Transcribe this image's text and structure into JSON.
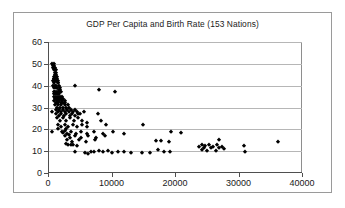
{
  "chart_data": {
    "type": "scatter",
    "title": "GDP Per Capita and Birth Rate (153 Nations)",
    "xlabel": "",
    "ylabel": "",
    "xlim": [
      0,
      40000
    ],
    "ylim": [
      0,
      60
    ],
    "xticks": [
      0,
      10000,
      20000,
      30000,
      40000
    ],
    "yticks": [
      0,
      10,
      20,
      30,
      40,
      50,
      60
    ],
    "xtick_labels": [
      "0",
      "10000",
      "20000",
      "30000",
      "40000"
    ],
    "ytick_labels": [
      "0",
      "10",
      "20",
      "30",
      "40",
      "50",
      "60"
    ],
    "grid": "horizontal",
    "legend": "none",
    "marker": "diamond",
    "marker_color": "#000000",
    "n_points": 153,
    "series": [
      {
        "name": "Nations",
        "points": [
          [
            700,
            50
          ],
          [
            760,
            49
          ],
          [
            820,
            48
          ],
          [
            900,
            50
          ],
          [
            950,
            47
          ],
          [
            1000,
            49
          ],
          [
            1050,
            46
          ],
          [
            1100,
            48
          ],
          [
            1150,
            45
          ],
          [
            1200,
            47
          ],
          [
            900,
            44
          ],
          [
            1000,
            43
          ],
          [
            1100,
            44
          ],
          [
            1250,
            46
          ],
          [
            1300,
            45
          ],
          [
            800,
            42
          ],
          [
            880,
            43
          ],
          [
            960,
            41
          ],
          [
            1050,
            42
          ],
          [
            1150,
            43
          ],
          [
            1250,
            42
          ],
          [
            1350,
            44
          ],
          [
            1400,
            43
          ],
          [
            1500,
            42
          ],
          [
            1550,
            41
          ],
          [
            850,
            40
          ],
          [
            950,
            39
          ],
          [
            1100,
            40
          ],
          [
            1200,
            39
          ],
          [
            1320,
            40
          ],
          [
            1450,
            39
          ],
          [
            1600,
            41
          ],
          [
            1700,
            40
          ],
          [
            1750,
            38
          ],
          [
            1850,
            39
          ],
          [
            900,
            37
          ],
          [
            1000,
            36
          ],
          [
            1150,
            37
          ],
          [
            1300,
            36
          ],
          [
            1400,
            37
          ],
          [
            1550,
            36
          ],
          [
            1700,
            37
          ],
          [
            1800,
            36
          ],
          [
            1950,
            38
          ],
          [
            2050,
            37
          ],
          [
            950,
            35
          ],
          [
            1100,
            34
          ],
          [
            1250,
            35
          ],
          [
            1400,
            34
          ],
          [
            1550,
            35
          ],
          [
            1700,
            34
          ],
          [
            1850,
            35
          ],
          [
            2000,
            34
          ],
          [
            2150,
            35
          ],
          [
            2300,
            34
          ],
          [
            1000,
            33
          ],
          [
            1200,
            32
          ],
          [
            1400,
            33
          ],
          [
            1600,
            32
          ],
          [
            1800,
            33
          ],
          [
            2000,
            32
          ],
          [
            2200,
            33
          ],
          [
            2400,
            32
          ],
          [
            2600,
            33
          ],
          [
            2750,
            32
          ],
          [
            1100,
            31
          ],
          [
            1350,
            30
          ],
          [
            1600,
            31
          ],
          [
            1850,
            30
          ],
          [
            2100,
            31
          ],
          [
            2350,
            30
          ],
          [
            2600,
            31
          ],
          [
            2850,
            30
          ],
          [
            3100,
            31
          ],
          [
            3300,
            30
          ],
          [
            600,
            28
          ],
          [
            1200,
            29
          ],
          [
            1500,
            28
          ],
          [
            1800,
            29
          ],
          [
            2100,
            28
          ],
          [
            2400,
            29
          ],
          [
            2700,
            28
          ],
          [
            3000,
            29
          ],
          [
            3300,
            28
          ],
          [
            3600,
            29
          ],
          [
            3900,
            28
          ],
          [
            4200,
            29
          ],
          [
            4600,
            28
          ],
          [
            5100,
            27
          ],
          [
            5600,
            28
          ],
          [
            1300,
            27
          ],
          [
            1700,
            26
          ],
          [
            2100,
            27
          ],
          [
            2500,
            26
          ],
          [
            2900,
            27
          ],
          [
            3400,
            26
          ],
          [
            3800,
            27
          ],
          [
            4300,
            26
          ],
          [
            4800,
            27
          ],
          [
            7900,
            27
          ],
          [
            1400,
            25
          ],
          [
            1900,
            24
          ],
          [
            2400,
            25
          ],
          [
            2900,
            24
          ],
          [
            3500,
            25
          ],
          [
            4100,
            24
          ],
          [
            4700,
            25
          ],
          [
            5400,
            24
          ],
          [
            6100,
            23
          ],
          [
            8400,
            24
          ],
          [
            1500,
            22
          ],
          [
            2000,
            21
          ],
          [
            2600,
            22
          ],
          [
            3200,
            21
          ],
          [
            3900,
            22
          ],
          [
            4600,
            21
          ],
          [
            5300,
            22
          ],
          [
            6200,
            21
          ],
          [
            9200,
            22
          ],
          [
            15000,
            22
          ],
          [
            650,
            19
          ],
          [
            1600,
            20
          ],
          [
            2200,
            19
          ],
          [
            2900,
            20
          ],
          [
            3600,
            19
          ],
          [
            4400,
            18
          ],
          [
            5200,
            19
          ],
          [
            6100,
            18
          ],
          [
            7200,
            19
          ],
          [
            8600,
            18
          ],
          [
            10200,
            19
          ],
          [
            11900,
            18
          ],
          [
            19300,
            19
          ],
          [
            21000,
            18.5
          ],
          [
            2600,
            17
          ],
          [
            3400,
            16
          ],
          [
            4300,
            17
          ],
          [
            5200,
            16
          ],
          [
            6300,
            17
          ],
          [
            7500,
            16
          ],
          [
            9000,
            17
          ],
          [
            3000,
            15
          ],
          [
            3800,
            14
          ],
          [
            4900,
            15
          ],
          [
            6000,
            14
          ],
          [
            7400,
            15
          ],
          [
            17000,
            14.5
          ],
          [
            17800,
            14.5
          ],
          [
            19000,
            14
          ],
          [
            27000,
            15
          ],
          [
            36200,
            14
          ],
          [
            24300,
            13
          ],
          [
            24800,
            12.5
          ],
          [
            25400,
            13
          ],
          [
            26000,
            12
          ],
          [
            26600,
            13
          ],
          [
            27400,
            12
          ],
          [
            30900,
            12.5
          ],
          [
            31100,
            9.8
          ],
          [
            4300,
            40
          ],
          [
            8000,
            38
          ],
          [
            10500,
            37
          ],
          [
            4200,
            9.6
          ],
          [
            5900,
            9.0
          ],
          [
            6300,
            8.9
          ],
          [
            6700,
            9.6
          ],
          [
            7300,
            9.8
          ],
          [
            8000,
            10.2
          ],
          [
            8600,
            9.7
          ],
          [
            9400,
            10.1
          ],
          [
            10100,
            9.0
          ],
          [
            11000,
            9.6
          ],
          [
            11900,
            9.5
          ],
          [
            13000,
            9.3
          ],
          [
            14800,
            9.2
          ],
          [
            16000,
            9.2
          ],
          [
            17400,
            10.5
          ],
          [
            18200,
            9.7
          ],
          [
            19200,
            9.6
          ],
          [
            23800,
            11.8
          ],
          [
            24200,
            10.6
          ],
          [
            24600,
            11.4
          ],
          [
            25000,
            10.2
          ],
          [
            25600,
            11.6
          ],
          [
            26400,
            10.3
          ],
          [
            27000,
            11.3
          ],
          [
            27700,
            11.0
          ],
          [
            3600,
            12.7
          ],
          [
            3900,
            13.0
          ],
          [
            4500,
            12.4
          ],
          [
            2800,
            13.2
          ],
          [
            3200,
            12.8
          ],
          [
            2400,
            18.5
          ],
          [
            2600,
            19.2
          ],
          [
            3000,
            18.0
          ],
          [
            3300,
            17.4
          ]
        ]
      }
    ]
  }
}
